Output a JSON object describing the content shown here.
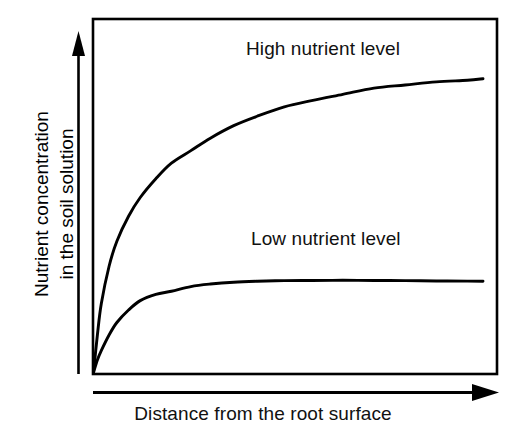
{
  "chart_data": {
    "type": "line",
    "title": "",
    "subtitle": "",
    "xlabel": "Distance from the root surface",
    "ylabel": "Nutrient concentration in the soil solution",
    "ylabel_lines": [
      "Nutrient concentration",
      "in the soil solution"
    ],
    "grid": false,
    "axes_style": "arrowed axes with boxed plot frame, no tick marks, no tick labels",
    "xlim": [
      0,
      1
    ],
    "ylim": [
      0,
      1
    ],
    "xticks": [],
    "yticks": [],
    "xticklabels": [],
    "yticklabels": [],
    "legend_position": "inline annotations above each curve",
    "annotations": [
      {
        "text": "High nutrient level",
        "x": 0.38,
        "y": 0.9
      },
      {
        "text": "Low nutrient level",
        "x": 0.39,
        "y": 0.4
      }
    ],
    "series": [
      {
        "name": "High nutrient level",
        "color": "#000000",
        "description": "Saturating rise from the root surface to a high plateau",
        "x": [
          0.0,
          0.01,
          0.02,
          0.04,
          0.06,
          0.09,
          0.12,
          0.16,
          0.2,
          0.25,
          0.3,
          0.36,
          0.42,
          0.49,
          0.56,
          0.64,
          0.72,
          0.8,
          0.88,
          0.96,
          1.0
        ],
        "y": [
          0.0,
          0.12,
          0.22,
          0.34,
          0.42,
          0.5,
          0.56,
          0.62,
          0.67,
          0.71,
          0.75,
          0.79,
          0.82,
          0.85,
          0.87,
          0.89,
          0.91,
          0.92,
          0.93,
          0.935,
          0.94
        ]
      },
      {
        "name": "Low nutrient level",
        "color": "#000000",
        "description": "Saturating rise from the root surface to a low plateau",
        "x": [
          0.0,
          0.01,
          0.02,
          0.04,
          0.06,
          0.09,
          0.12,
          0.16,
          0.2,
          0.25,
          0.3,
          0.36,
          0.42,
          0.49,
          0.56,
          0.64,
          0.72,
          0.8,
          0.88,
          0.96,
          1.0
        ],
        "y": [
          0.0,
          0.04,
          0.07,
          0.12,
          0.16,
          0.2,
          0.23,
          0.25,
          0.26,
          0.275,
          0.283,
          0.289,
          0.292,
          0.294,
          0.2945,
          0.295,
          0.2945,
          0.294,
          0.293,
          0.2925,
          0.292
        ]
      }
    ]
  },
  "axes": {
    "x_arrow_name": "distance-axis-arrow",
    "y_arrow_name": "concentration-axis-arrow"
  },
  "colors": {
    "line": "#000000",
    "frame": "#000000",
    "background": "#ffffff",
    "text": "#111111"
  }
}
